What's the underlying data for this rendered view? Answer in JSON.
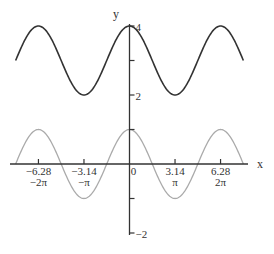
{
  "chart_data": {
    "type": "line",
    "title": "",
    "xlabel": "x",
    "ylabel": "y",
    "xlim": [
      -7.85,
      7.85
    ],
    "ylim": [
      -2,
      4
    ],
    "grid": false,
    "legend": null,
    "x_ticks": [
      {
        "value": -6.28,
        "label": "−6.28",
        "sublabel": "−2π"
      },
      {
        "value": -3.14,
        "label": "−3.14",
        "sublabel": "−π"
      },
      {
        "value": 0,
        "label": "0",
        "sublabel": ""
      },
      {
        "value": 3.14,
        "label": "3.14",
        "sublabel": "π"
      },
      {
        "value": 6.28,
        "label": "6.28",
        "sublabel": "2π"
      }
    ],
    "y_ticks": [
      {
        "value": 4,
        "label": "4"
      },
      {
        "value": 3,
        "label": ""
      },
      {
        "value": 2,
        "label": "2"
      },
      {
        "value": 1,
        "label": ""
      },
      {
        "value": -1,
        "label": ""
      },
      {
        "value": -2,
        "label": "−2"
      }
    ],
    "series": [
      {
        "name": "y = 3 + cos x",
        "color": "#333333",
        "x_range": [
          -7.854,
          7.854
        ],
        "offset": 3,
        "amplitude": 1
      },
      {
        "name": "y = cos x",
        "color": "#aaaaaa",
        "x_range": [
          -7.854,
          7.854
        ],
        "offset": 0,
        "amplitude": 1
      }
    ]
  },
  "layout": {
    "origin_px": [
      129.5,
      164
    ],
    "px_per_unit_x": 14.5,
    "px_per_unit_y": 34.5,
    "x_axis_px": [
      10,
      248
    ],
    "y_axis_px": [
      24,
      235
    ]
  }
}
